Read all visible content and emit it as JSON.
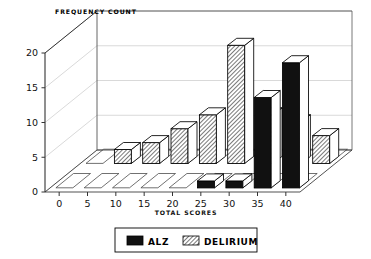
{
  "chart_data": {
    "type": "bar",
    "title": "FREQUENCY COUNT",
    "xlabel": "TOTAL SCORES",
    "ylabel": "FREQUENCY COUNT",
    "style": "3d-grouped-bar",
    "grid": true,
    "legend_position": "bottom",
    "categories": [
      "0",
      "5",
      "10",
      "15",
      "20",
      "25",
      "30",
      "35",
      "40"
    ],
    "yticks": [
      "0",
      "5",
      "10",
      "15",
      "20"
    ],
    "ylim": [
      0,
      20
    ],
    "series": [
      {
        "name": "DELIRIUM",
        "fill": "hatched",
        "values": [
          0,
          2,
          3,
          5,
          7,
          17,
          7,
          6,
          4
        ]
      },
      {
        "name": "ALZ",
        "fill": "solid-black",
        "values": [
          0,
          0,
          0,
          0,
          0,
          1,
          1,
          13,
          18
        ]
      }
    ]
  },
  "chart": {
    "title": "FREQUENCY COUNT",
    "xlabel": "TOTAL SCORES",
    "yticks": [
      {
        "label": "20"
      },
      {
        "label": "15"
      },
      {
        "label": "10"
      },
      {
        "label": "5"
      },
      {
        "label": "0"
      }
    ],
    "xticks": [
      {
        "label": "0"
      },
      {
        "label": "5"
      },
      {
        "label": "10"
      },
      {
        "label": "15"
      },
      {
        "label": "20"
      },
      {
        "label": "25"
      },
      {
        "label": "30"
      },
      {
        "label": "35"
      },
      {
        "label": "40"
      }
    ]
  },
  "legend": {
    "items": [
      {
        "label": "ALZ",
        "swatch": "solid-black"
      },
      {
        "label": "DELIRIUM",
        "swatch": "hatched"
      }
    ]
  },
  "colors": {
    "ink": "#000000",
    "grid": "#c9c9c9",
    "paper": "#ffffff",
    "alz": "#111111",
    "delirium": "#ffffff"
  }
}
